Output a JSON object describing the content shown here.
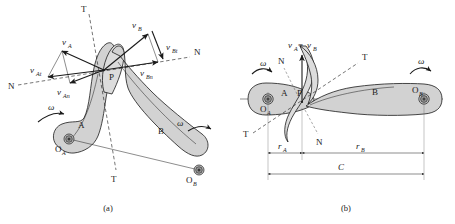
{
  "figure": {
    "captions": {
      "a": "(a)",
      "b": "(b)"
    },
    "colors": {
      "body_fill": "#d2d2d2",
      "body_fill_light": "#dcdcdc",
      "line": "#1a1a1a",
      "construction": "#6a6a6a",
      "background": "#ffffff"
    }
  },
  "panel_a": {
    "caption": "(a)",
    "bodies": [
      {
        "id": "A",
        "label": "A",
        "pivot_label": "O",
        "pivot_sub": "A"
      },
      {
        "id": "B",
        "label": "B",
        "pivot_label": "O",
        "pivot_sub": "B"
      }
    ],
    "contact_point": "P",
    "axes": [
      {
        "name": "tangent-axis",
        "label_top": "T",
        "label_bottom": "T"
      },
      {
        "name": "normal-axis",
        "label_left": "N",
        "label_right": "N"
      }
    ],
    "angular_velocities": [
      {
        "body": "A",
        "symbol": "ω"
      },
      {
        "body": "B",
        "symbol": "ω"
      }
    ],
    "vectors": [
      {
        "name": "v-A",
        "base": "v",
        "sub": "A",
        "desc": "velocity of point on body A"
      },
      {
        "name": "v-At",
        "base": "v",
        "sub": "At",
        "desc": "tangential component of v_A"
      },
      {
        "name": "v-An",
        "base": "v",
        "sub": "An",
        "desc": "normal component of v_A"
      },
      {
        "name": "v-B",
        "base": "v",
        "sub": "B",
        "desc": "velocity of point on body B"
      },
      {
        "name": "v-Bt",
        "base": "v",
        "sub": "Bt",
        "desc": "tangential component of v_B"
      },
      {
        "name": "v-Bn",
        "base": "v",
        "sub": "Bn",
        "desc": "normal component of v_B"
      }
    ]
  },
  "panel_b": {
    "caption": "(b)",
    "bodies": [
      {
        "id": "A",
        "label": "A",
        "pivot_label": "O",
        "pivot_sub": "A"
      },
      {
        "id": "B",
        "label": "B",
        "pivot_label": "O",
        "pivot_sub": "B"
      }
    ],
    "contact_point": "P",
    "velocity_label": {
      "base": "v",
      "sub_a": "A",
      "equals": "=",
      "base2": "v",
      "sub_b": "B",
      "text": "vₐ = vᵦ"
    },
    "axes": [
      {
        "name": "tangent-axis",
        "label_upper_right": "T",
        "label_lower_left": "T"
      },
      {
        "name": "normal-axis",
        "label_upper_left": "N",
        "label_lower_right": "N"
      }
    ],
    "angular_velocities": [
      {
        "body": "A",
        "symbol": "ω"
      },
      {
        "body": "B",
        "symbol": "ω"
      }
    ],
    "dimensions": [
      {
        "name": "r-A",
        "base": "r",
        "sub": "A",
        "desc": "distance from O_A to P"
      },
      {
        "name": "r-B",
        "base": "r",
        "sub": "B",
        "desc": "distance from P to O_B"
      },
      {
        "name": "C",
        "base": "C",
        "sub": "",
        "desc": "center distance O_A to O_B"
      }
    ]
  }
}
